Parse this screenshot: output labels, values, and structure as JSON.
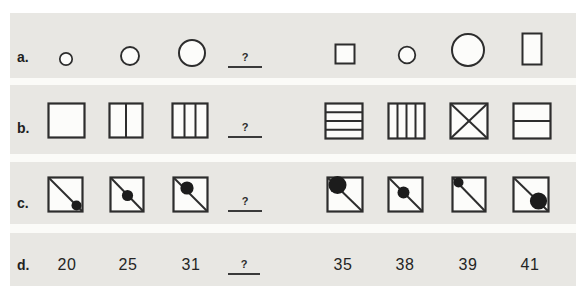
{
  "figure": {
    "type": "pattern-completion-puzzle",
    "colors": {
      "page_background": "#ffffff",
      "panel_background": "#e8e7e3",
      "separator": "#fbfbf8",
      "stroke": "#2d2d2d",
      "shape_fill": "#fcfcfa",
      "dot": "#1c1c1c",
      "text": "#242424"
    },
    "rows": [
      {
        "label": "a.",
        "blank": "?",
        "stimulus": [
          "small-circle",
          "medium-circle",
          "large-circle"
        ],
        "options": [
          "small-square",
          "small-circle",
          "large-circle",
          "tall-rectangle"
        ]
      },
      {
        "label": "b.",
        "blank": "?",
        "stimulus": [
          "empty-square",
          "square-split-into-2-vertical-parts",
          "square-split-into-3-vertical-parts"
        ],
        "options": [
          "square-split-into-4-horizontal-bands",
          "square-split-into-4-vertical-bands",
          "square-with-diagonal-cross",
          "square-split-into-2-horizontal-bands"
        ]
      },
      {
        "label": "c.",
        "blank": "?",
        "stimulus": [
          "square-diagonal-small-dot-bottom-right",
          "square-diagonal-medium-dot-center",
          "square-diagonal-large-dot-top-left"
        ],
        "options": [
          "square-diagonal-extra-large-dot-top-left",
          "square-diagonal-medium-dot-center",
          "square-diagonal-small-dot-top-left",
          "square-diagonal-large-dot-bottom-right"
        ]
      },
      {
        "label": "d.",
        "blank": "?",
        "stimulus": [
          "20",
          "25",
          "31"
        ],
        "options": [
          "35",
          "38",
          "39",
          "41"
        ]
      }
    ]
  }
}
